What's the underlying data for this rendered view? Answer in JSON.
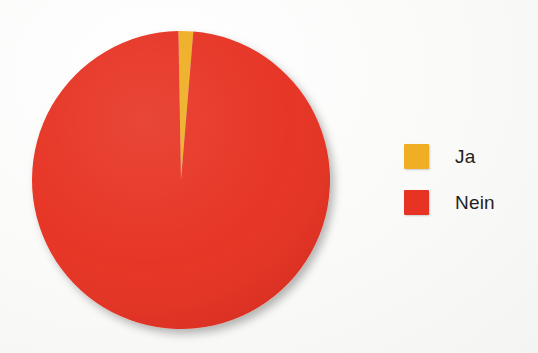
{
  "background_color": "#fbfbfa",
  "chart_data": {
    "type": "pie",
    "title": "",
    "labels": [
      "Ja",
      "Nein"
    ],
    "values": [
      1.6,
      98.4
    ],
    "unit": "percent",
    "colors": [
      "#efae24",
      "#e63323"
    ],
    "start_angle_deg": -1,
    "direction": "clockwise",
    "legend_position": "right",
    "grid": false,
    "slices": [
      {
        "label": "Ja",
        "value": 1.6,
        "color": "#efae24"
      },
      {
        "label": "Nein",
        "value": 98.4,
        "color": "#e63323"
      }
    ]
  },
  "legend": {
    "items": [
      {
        "label": "Ja",
        "color": "#efae24",
        "swatch_name": "legend-swatch-ja"
      },
      {
        "label": "Nein",
        "color": "#e63323",
        "swatch_name": "legend-swatch-nein"
      }
    ]
  }
}
